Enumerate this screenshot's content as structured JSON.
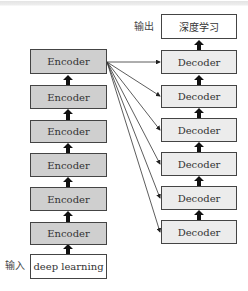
{
  "diagram": {
    "type": "encoder-decoder stack",
    "input_label": "输入",
    "input_text": "deep learning",
    "output_label": "输出",
    "output_text": "深度学习",
    "encoders": [
      "Encoder",
      "Encoder",
      "Encoder",
      "Encoder",
      "Encoder",
      "Encoder"
    ],
    "decoders": [
      "Decoder",
      "Decoder",
      "Decoder",
      "Decoder",
      "Decoder",
      "Decoder"
    ],
    "edges": [
      {
        "from": "input",
        "to": "encoder-6",
        "style": "thick-arrow"
      },
      {
        "from": "encoder-6",
        "to": "encoder-5",
        "style": "thick-arrow"
      },
      {
        "from": "encoder-5",
        "to": "encoder-4",
        "style": "thick-arrow"
      },
      {
        "from": "encoder-4",
        "to": "encoder-3",
        "style": "thick-arrow"
      },
      {
        "from": "encoder-3",
        "to": "encoder-2",
        "style": "thick-arrow"
      },
      {
        "from": "encoder-2",
        "to": "encoder-1",
        "style": "thick-arrow"
      },
      {
        "from": "encoder-1",
        "to": "decoder-1",
        "style": "thin-arrow"
      },
      {
        "from": "encoder-1",
        "to": "decoder-2",
        "style": "thin-arrow"
      },
      {
        "from": "encoder-1",
        "to": "decoder-3",
        "style": "thin-arrow"
      },
      {
        "from": "encoder-1",
        "to": "decoder-4",
        "style": "thin-arrow"
      },
      {
        "from": "encoder-1",
        "to": "decoder-5",
        "style": "thin-arrow"
      },
      {
        "from": "encoder-1",
        "to": "decoder-6",
        "style": "thin-arrow"
      },
      {
        "from": "decoder-6",
        "to": "decoder-5",
        "style": "thick-arrow"
      },
      {
        "from": "decoder-5",
        "to": "decoder-4",
        "style": "thick-arrow"
      },
      {
        "from": "decoder-4",
        "to": "decoder-3",
        "style": "thick-arrow"
      },
      {
        "from": "decoder-3",
        "to": "decoder-2",
        "style": "thick-arrow"
      },
      {
        "from": "decoder-2",
        "to": "decoder-1",
        "style": "thick-arrow"
      },
      {
        "from": "decoder-1",
        "to": "output",
        "style": "thick-arrow"
      }
    ]
  },
  "colors": {
    "encoder_fill": "#cfcfcf",
    "decoder_fill": "#ececec",
    "io_fill": "#ffffff",
    "border": "#444444",
    "arrow": "#111111"
  }
}
